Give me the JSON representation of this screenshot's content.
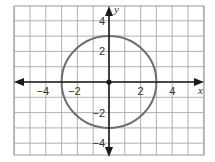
{
  "chart_data": {
    "type": "scatter",
    "title": "",
    "xlabel": "x",
    "ylabel": "y",
    "xlim": [
      -6,
      6
    ],
    "ylim": [
      -4.8,
      5
    ],
    "grid": true,
    "x_ticks": [
      -4,
      -2,
      2,
      4
    ],
    "y_ticks": [
      4,
      2,
      -2,
      -4
    ],
    "x_tick_labels": [
      "−4",
      "−2",
      "2",
      "4"
    ],
    "y_tick_labels": [
      "4",
      "2",
      "−2",
      "−4"
    ],
    "series": [
      {
        "name": "circle",
        "shape": "circle",
        "center": [
          0,
          0
        ],
        "radius": 3,
        "equation": "x^2 + y^2 = 9",
        "color": "#6e6e6e"
      },
      {
        "name": "center point",
        "shape": "point",
        "x": [
          0
        ],
        "y": [
          0
        ],
        "color": "#1a1a1a"
      }
    ]
  },
  "axes": {
    "x_label": "x",
    "y_label": "y"
  },
  "colors": {
    "grid": "#a8a8a8",
    "axis": "#1a1a1a",
    "circle": "#6e6e6e"
  }
}
